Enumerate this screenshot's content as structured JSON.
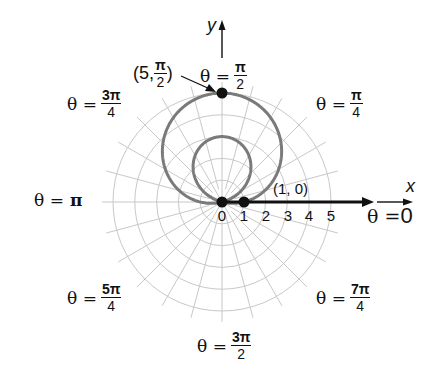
{
  "figure": {
    "type": "polar-graph",
    "equation_implied": "r = 1 + 4 sin θ",
    "axes": {
      "x_label": "x",
      "y_label": "y"
    },
    "radial_ticks": [
      "0",
      "1",
      "2",
      "3",
      "4",
      "5"
    ],
    "angle_labels": {
      "theta_0": {
        "prefix": "θ = ",
        "value": "0"
      },
      "theta_pi_4": {
        "prefix": "θ =",
        "num": "π",
        "den": "4"
      },
      "theta_pi_2": {
        "prefix": "θ =",
        "num": "π",
        "den": "2"
      },
      "theta_3pi_4": {
        "prefix": "θ =",
        "num": "3π",
        "den": "4"
      },
      "theta_pi": {
        "prefix": "θ =",
        "value": "π"
      },
      "theta_5pi_4": {
        "prefix": "θ =",
        "num": "5π",
        "den": "4"
      },
      "theta_3pi_2": {
        "prefix": "θ =",
        "num": "3π",
        "den": "2"
      },
      "theta_7pi_4": {
        "prefix": "θ =",
        "num": "7π",
        "den": "4"
      }
    },
    "points": [
      {
        "label": "(1, 0)",
        "r": 1,
        "theta": "0"
      },
      {
        "label_open": "(5, ",
        "label_num": "π",
        "label_den": "2",
        "label_close": ")",
        "r": 5,
        "theta": "π/2"
      },
      {
        "label": "0",
        "r": 0,
        "theta": "pole"
      }
    ],
    "colors": {
      "curve": "#7a7a7a",
      "grid": "#c8c8c8",
      "axis": "#111111",
      "background": "#ffffff"
    }
  }
}
